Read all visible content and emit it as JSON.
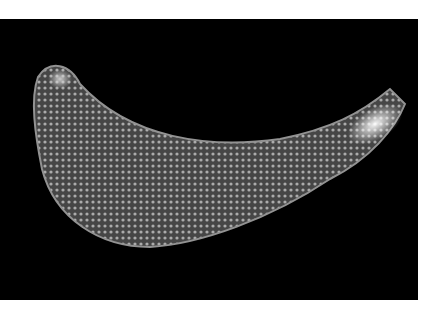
{
  "image": {
    "subject": "sea cucumber on black background",
    "alt": "Photograph of a curved, bumpy sea cucumber against a black background",
    "background_color": "#000000",
    "page_color": "#ffffff",
    "body_color": "#8a8a8a",
    "highlight_color": "#f0f0f0"
  }
}
